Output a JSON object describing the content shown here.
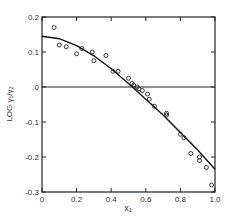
{
  "chart_data": {
    "type": "scatter",
    "title": "",
    "xlabel": "x₁",
    "ylabel": "LOG γ₁/γ₂",
    "xlim": [
      0,
      1.0
    ],
    "ylim": [
      -0.3,
      0.2
    ],
    "grid": false,
    "legend": null,
    "x_ticks": [
      "0",
      "0.2",
      "0.4",
      "0.6",
      "0.8",
      "1.0"
    ],
    "y_ticks": [
      "0.2",
      "0.1",
      "0",
      "-0.1",
      "-0.2",
      "-0.3"
    ],
    "zero_line": true,
    "series": [
      {
        "name": "experimental",
        "style": "open-circle",
        "x": [
          0.07,
          0.1,
          0.14,
          0.2,
          0.23,
          0.29,
          0.3,
          0.37,
          0.41,
          0.44,
          0.5,
          0.52,
          0.53,
          0.55,
          0.56,
          0.58,
          0.61,
          0.62,
          0.65,
          0.72,
          0.72,
          0.8,
          0.82,
          0.86,
          0.91,
          0.91,
          0.95,
          0.98
        ],
        "y": [
          0.17,
          0.12,
          0.115,
          0.095,
          0.11,
          0.1,
          0.075,
          0.09,
          0.045,
          0.045,
          0.025,
          0.01,
          0.005,
          0.0,
          -0.005,
          -0.01,
          -0.02,
          -0.035,
          -0.055,
          -0.075,
          -0.08,
          -0.135,
          -0.145,
          -0.19,
          -0.2,
          -0.21,
          -0.23,
          -0.28
        ]
      },
      {
        "name": "fit",
        "style": "line",
        "x": [
          0.0,
          0.1,
          0.2,
          0.3,
          0.4,
          0.5,
          0.6,
          0.7,
          0.8,
          0.9,
          1.0
        ],
        "y": [
          0.145,
          0.138,
          0.118,
          0.089,
          0.052,
          0.01,
          -0.035,
          -0.08,
          -0.13,
          -0.18,
          -0.235
        ]
      }
    ]
  }
}
